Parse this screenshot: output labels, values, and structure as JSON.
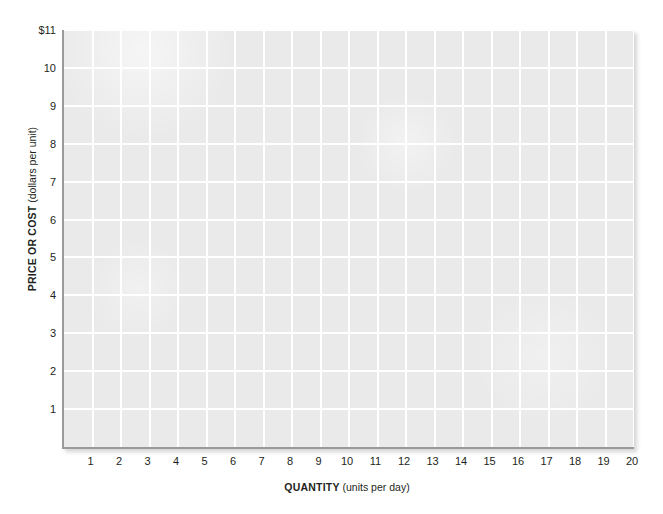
{
  "chart_data": {
    "type": "line",
    "title": "",
    "subtitle": "",
    "xlabel_main": "QUANTITY",
    "xlabel_unit": "(units per day)",
    "ylabel_main": "PRICE OR COST",
    "ylabel_unit": "(dollars per unit)",
    "xlim": [
      0,
      20
    ],
    "ylim": [
      0,
      11
    ],
    "xticks": [
      "1",
      "2",
      "3",
      "4",
      "5",
      "6",
      "7",
      "8",
      "9",
      "10",
      "11",
      "12",
      "13",
      "14",
      "15",
      "16",
      "17",
      "18",
      "19",
      "20"
    ],
    "xtick_values": [
      1,
      2,
      3,
      4,
      5,
      6,
      7,
      8,
      9,
      10,
      11,
      12,
      13,
      14,
      15,
      16,
      17,
      18,
      19,
      20
    ],
    "yticks": [
      "1",
      "2",
      "3",
      "4",
      "5",
      "6",
      "7",
      "8",
      "9",
      "10",
      "$11"
    ],
    "ytick_values": [
      1,
      2,
      3,
      4,
      5,
      6,
      7,
      8,
      9,
      10,
      11
    ],
    "grid": true,
    "grid_color": "#ffffff",
    "plot_background": "#eaeaea",
    "axis_color": "#9a9a9a",
    "text_color": "#231f20",
    "legend": [],
    "series": [],
    "annotations": [],
    "note": "blank graph grid template; no data series plotted"
  }
}
